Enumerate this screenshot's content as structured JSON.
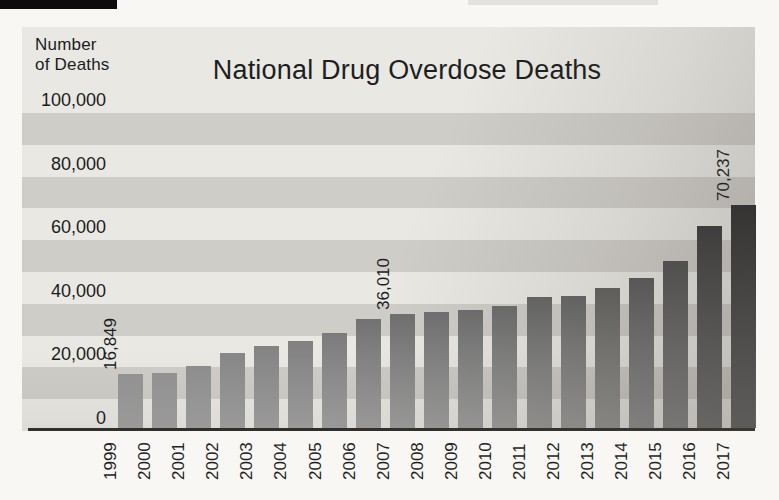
{
  "y_axis_title": {
    "line1": "Number",
    "line2": "of Deaths"
  },
  "chart_data": {
    "type": "bar",
    "title": "National Drug Overdose Deaths",
    "ylabel": "Number of Deaths",
    "xlabel": "",
    "ylim": [
      0,
      100000
    ],
    "ytick_interval": 20000,
    "band_interval": 10000,
    "grid": "alternating horizontal shaded bands, no gridlines",
    "legend": "none",
    "yticks": [
      {
        "value": 100000,
        "label": "100,000"
      },
      {
        "value": 80000,
        "label": "80,000"
      },
      {
        "value": 60000,
        "label": "60,000"
      },
      {
        "value": 40000,
        "label": "40,000"
      },
      {
        "value": 20000,
        "label": "20,000"
      },
      {
        "value": 0,
        "label": "0"
      }
    ],
    "categories": [
      "1999",
      "2000",
      "2001",
      "2002",
      "2003",
      "2004",
      "2005",
      "2006",
      "2007",
      "2008",
      "2009",
      "2010",
      "2011",
      "2012",
      "2013",
      "2014",
      "2015",
      "2016",
      "2017"
    ],
    "values": [
      16849,
      17415,
      19394,
      23518,
      25785,
      27424,
      29813,
      34425,
      36010,
      36450,
      37004,
      38329,
      41340,
      41502,
      43982,
      47055,
      52404,
      63632,
      70237
    ],
    "value_labels": [
      {
        "category": "1999",
        "text": "16,849"
      },
      {
        "category": "2007",
        "text": "36,010"
      },
      {
        "category": "2017",
        "text": "70,237"
      }
    ],
    "colors": {
      "page_background": "#f8f7f3",
      "band_light": "#e9e8e3",
      "band_dark": "#cfcdc8",
      "bar_gradient_darkest": "#2e2e2e",
      "bar_gradient_lightest": "#949494",
      "axis_line": "#2f2d2a",
      "text": "#1c1c1c"
    }
  }
}
